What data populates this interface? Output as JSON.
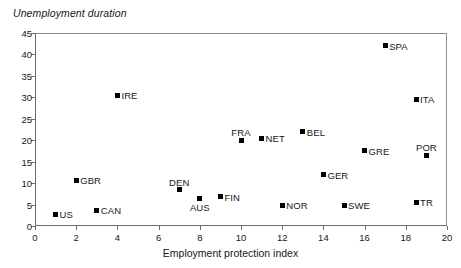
{
  "chart_data": {
    "type": "scatter",
    "title": "Unemployment duration",
    "xlabel": "Employment protection index",
    "ylabel": "Unemployment duration",
    "xlim": [
      0,
      20
    ],
    "ylim": [
      0,
      45
    ],
    "xticks": [
      0,
      2,
      4,
      6,
      8,
      10,
      12,
      14,
      16,
      18,
      20
    ],
    "yticks": [
      0,
      5,
      10,
      15,
      20,
      25,
      30,
      35,
      40,
      45
    ],
    "grid": false,
    "legend": "none",
    "marker": "filled-square",
    "marker_color": "#000000",
    "points": [
      {
        "label": "US",
        "x": 1,
        "y": 2.7,
        "label_pos": "right"
      },
      {
        "label": "GBR",
        "x": 2,
        "y": 10.7,
        "label_pos": "right"
      },
      {
        "label": "CAN",
        "x": 3,
        "y": 3.7,
        "label_pos": "right"
      },
      {
        "label": "IRE",
        "x": 4,
        "y": 30.5,
        "label_pos": "right"
      },
      {
        "label": "DEN",
        "x": 7,
        "y": 8.5,
        "label_pos": "above"
      },
      {
        "label": "AUS",
        "x": 8,
        "y": 6.5,
        "label_pos": "below"
      },
      {
        "label": "FIN",
        "x": 9,
        "y": 6.8,
        "label_pos": "right"
      },
      {
        "label": "FRA",
        "x": 10,
        "y": 20.0,
        "label_pos": "above"
      },
      {
        "label": "NET",
        "x": 11,
        "y": 20.5,
        "label_pos": "right"
      },
      {
        "label": "NOR",
        "x": 12,
        "y": 4.8,
        "label_pos": "right"
      },
      {
        "label": "BEL",
        "x": 13,
        "y": 22.0,
        "label_pos": "right"
      },
      {
        "label": "GER",
        "x": 14,
        "y": 12.0,
        "label_pos": "right"
      },
      {
        "label": "SWE",
        "x": 15,
        "y": 4.8,
        "label_pos": "right"
      },
      {
        "label": "GRE",
        "x": 16,
        "y": 17.5,
        "label_pos": "right"
      },
      {
        "label": "SPA",
        "x": 17,
        "y": 42.0,
        "label_pos": "right"
      },
      {
        "label": "ITA",
        "x": 18.5,
        "y": 29.5,
        "label_pos": "right"
      },
      {
        "label": "TR",
        "x": 18.5,
        "y": 5.5,
        "label_pos": "right"
      },
      {
        "label": "POR",
        "x": 19,
        "y": 16.5,
        "label_pos": "above"
      }
    ]
  }
}
